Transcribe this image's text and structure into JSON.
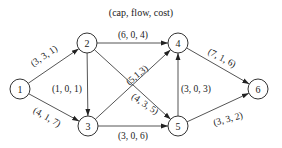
{
  "title": "(cap, flow, cost)",
  "colors": {
    "stroke": "#555555",
    "text": "#222222",
    "background": "#ffffff"
  },
  "nodes": [
    {
      "id": "1",
      "label": "1"
    },
    {
      "id": "2",
      "label": "2"
    },
    {
      "id": "3",
      "label": "3"
    },
    {
      "id": "4",
      "label": "4"
    },
    {
      "id": "5",
      "label": "5"
    },
    {
      "id": "6",
      "label": "6"
    }
  ],
  "edges": [
    {
      "from": "1",
      "to": "2",
      "cap": 3,
      "flow": 3,
      "cost": 1,
      "label": "(3, 3, 1)"
    },
    {
      "from": "1",
      "to": "3",
      "cap": 4,
      "flow": 1,
      "cost": 7,
      "label": "(4, 1, 7)"
    },
    {
      "from": "2",
      "to": "4",
      "cap": 6,
      "flow": 0,
      "cost": 4,
      "label": "(6, 0, 4)"
    },
    {
      "from": "2",
      "to": "3",
      "cap": 1,
      "flow": 0,
      "cost": 1,
      "label": "(1, 0, 1)"
    },
    {
      "from": "2",
      "to": "5",
      "cap": 4,
      "flow": 3,
      "cost": 5,
      "label": "(4, 3, 5)"
    },
    {
      "from": "3",
      "to": "4",
      "cap": 5,
      "flow": 1,
      "cost": 3,
      "label": "(5,1,3)"
    },
    {
      "from": "3",
      "to": "5",
      "cap": 3,
      "flow": 0,
      "cost": 6,
      "label": "(3, 0, 6)"
    },
    {
      "from": "5",
      "to": "4",
      "cap": 3,
      "flow": 0,
      "cost": 3,
      "label": "(3, 0, 3)"
    },
    {
      "from": "4",
      "to": "6",
      "cap": 7,
      "flow": 1,
      "cost": 6,
      "label": "(7, 1, 6)"
    },
    {
      "from": "5",
      "to": "6",
      "cap": 3,
      "flow": 3,
      "cost": 2,
      "label": "(3, 3, 2)"
    }
  ]
}
